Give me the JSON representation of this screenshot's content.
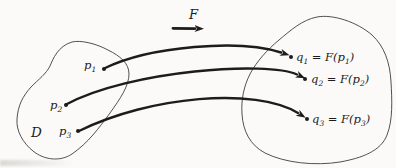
{
  "colors": {
    "ink": "#1c1c1c",
    "outline": "#3d3d3d",
    "background": "#fbfaf8",
    "artifact": "#d9d9d4"
  },
  "diagram": {
    "function_label": "F",
    "domain_label": "D",
    "domain_points": [
      {
        "name": "p",
        "sub": "1"
      },
      {
        "name": "p",
        "sub": "2"
      },
      {
        "name": "p",
        "sub": "3"
      }
    ],
    "image_points": [
      {
        "name": "q",
        "sub": "1",
        "eq": " = ",
        "func": "F(",
        "arg": "p",
        "arg_sub": "1",
        "close": ")"
      },
      {
        "name": "q",
        "sub": "2",
        "eq": " = ",
        "func": "F(",
        "arg": "p",
        "arg_sub": "2",
        "close": ")"
      },
      {
        "name": "q",
        "sub": "3",
        "eq": " = ",
        "func": "F(",
        "arg": "p",
        "arg_sub": "3",
        "close": ")"
      }
    ]
  }
}
